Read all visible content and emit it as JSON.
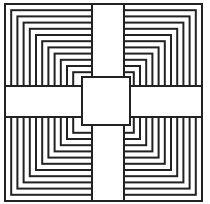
{
  "figure": {
    "stroke_color": "#222222",
    "fill_color": "#ffffff",
    "outer": {
      "x": 5,
      "y": 4,
      "size": 197
    },
    "ring_count": 12,
    "ring_step": 6.2,
    "vertical_band": {
      "x": 92,
      "width": 32
    },
    "horizontal_band": {
      "y": 86,
      "height": 31
    },
    "center_square": {
      "x": 82,
      "y": 77,
      "size": 48
    }
  }
}
